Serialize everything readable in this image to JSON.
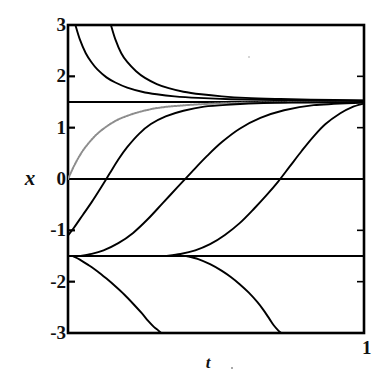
{
  "chart_data": {
    "type": "line",
    "title": "",
    "xlabel": "t",
    "ylabel": "x",
    "xlim": [
      0,
      1
    ],
    "ylim": [
      -3,
      3
    ],
    "grid": false,
    "legend": null,
    "xticklabels": [
      "1"
    ],
    "xtickvalues": [
      1
    ],
    "yticklabels": [
      "3",
      "2",
      "1",
      "0",
      "-1",
      "-2",
      "-3"
    ],
    "ytickvalues": [
      3,
      2,
      1,
      0,
      -1,
      -2,
      -3
    ],
    "asymptotes": [
      {
        "name": "upper-equilibrium",
        "y": 1.5,
        "style": "solid",
        "color": "#000000"
      },
      {
        "name": "zero-line",
        "y": 0.0,
        "style": "solid",
        "color": "#000000"
      },
      {
        "name": "lower-equilibrium",
        "y": -1.5,
        "style": "solid",
        "color": "#000000"
      }
    ],
    "series": [
      {
        "name": "upper-decay-1",
        "color": "#000000",
        "style": "solid",
        "description": "decays from x=3 at t=0.025 down to the upper equilibrium 1.5",
        "x": [
          0.025,
          0.04,
          0.06,
          0.08,
          0.1,
          0.13,
          0.16,
          0.2,
          0.25,
          0.3,
          0.36,
          0.44,
          0.55,
          0.7,
          0.85,
          1.0
        ],
        "y": [
          3.0,
          2.72,
          2.45,
          2.27,
          2.13,
          1.98,
          1.88,
          1.78,
          1.7,
          1.65,
          1.61,
          1.58,
          1.555,
          1.54,
          1.53,
          1.525
        ]
      },
      {
        "name": "upper-decay-2",
        "color": "#000000",
        "style": "solid",
        "description": "decays from x=3 at t=0.145 down to the upper equilibrium 1.5",
        "x": [
          0.145,
          0.16,
          0.18,
          0.2,
          0.23,
          0.26,
          0.3,
          0.34,
          0.39,
          0.45,
          0.52,
          0.6,
          0.7,
          0.82,
          1.0
        ],
        "y": [
          3.0,
          2.72,
          2.45,
          2.28,
          2.1,
          1.97,
          1.85,
          1.77,
          1.7,
          1.65,
          1.61,
          1.58,
          1.56,
          1.545,
          1.53
        ]
      },
      {
        "name": "sigmoid-gray-from-zero",
        "color": "#8d8d8d",
        "style": "dotted",
        "description": "rises from the origin (0,0) to the upper equilibrium 1.5",
        "x": [
          0.0,
          0.02,
          0.04,
          0.06,
          0.09,
          0.12,
          0.16,
          0.2,
          0.25,
          0.31,
          0.38,
          0.46,
          0.56,
          0.68,
          0.82,
          1.0
        ],
        "y": [
          0.0,
          0.25,
          0.46,
          0.63,
          0.83,
          0.98,
          1.13,
          1.23,
          1.32,
          1.39,
          1.43,
          1.46,
          1.48,
          1.49,
          1.495,
          1.5
        ]
      },
      {
        "name": "sigmoid-1",
        "color": "#000000",
        "style": "solid",
        "description": "S-curve from x=-1.1 at t=0 up to the upper equilibrium 1.5",
        "x": [
          0.0,
          0.02,
          0.05,
          0.08,
          0.11,
          0.14,
          0.17,
          0.2,
          0.24,
          0.28,
          0.33,
          0.39,
          0.46,
          0.55,
          0.66,
          0.8,
          1.0
        ],
        "y": [
          -1.1,
          -0.95,
          -0.7,
          -0.45,
          -0.18,
          0.1,
          0.38,
          0.62,
          0.88,
          1.07,
          1.22,
          1.33,
          1.41,
          1.45,
          1.48,
          1.49,
          1.5
        ]
      },
      {
        "name": "sigmoid-2",
        "color": "#000000",
        "style": "solid",
        "description": "S-curve emerging from the lower equilibrium -1.5 near t=0.06, crossing zero at t~0.44, approaching 1.5",
        "x": [
          0.04,
          0.08,
          0.12,
          0.17,
          0.22,
          0.27,
          0.32,
          0.37,
          0.42,
          0.47,
          0.52,
          0.58,
          0.65,
          0.73,
          0.83,
          1.0
        ],
        "y": [
          -1.5,
          -1.46,
          -1.39,
          -1.25,
          -1.05,
          -0.78,
          -0.47,
          -0.16,
          0.15,
          0.45,
          0.72,
          0.98,
          1.19,
          1.34,
          1.44,
          1.49
        ]
      },
      {
        "name": "sigmoid-3",
        "color": "#000000",
        "style": "solid",
        "description": "S-curve emerging from the lower equilibrium -1.5 near t=0.35, crossing zero at t~0.73, approaching 1.5 at t=1",
        "x": [
          0.33,
          0.38,
          0.43,
          0.48,
          0.53,
          0.58,
          0.63,
          0.67,
          0.71,
          0.75,
          0.79,
          0.83,
          0.87,
          0.92,
          0.96,
          1.0
        ],
        "y": [
          -1.5,
          -1.46,
          -1.39,
          -1.27,
          -1.09,
          -0.86,
          -0.57,
          -0.32,
          -0.05,
          0.25,
          0.55,
          0.83,
          1.07,
          1.28,
          1.4,
          1.47
        ]
      },
      {
        "name": "lower-divergence-1",
        "color": "#000000",
        "style": "solid",
        "description": "diverges downward from the lower equilibrium -1.5 near t=0.02 and reaches x=-3 at t~0.32",
        "x": [
          0.015,
          0.04,
          0.07,
          0.1,
          0.13,
          0.16,
          0.19,
          0.22,
          0.25,
          0.27,
          0.29,
          0.305,
          0.315
        ],
        "y": [
          -1.5,
          -1.57,
          -1.68,
          -1.8,
          -1.94,
          -2.09,
          -2.25,
          -2.43,
          -2.62,
          -2.76,
          -2.88,
          -2.95,
          -3.0
        ]
      },
      {
        "name": "lower-divergence-2",
        "color": "#000000",
        "style": "solid",
        "description": "diverges downward from the lower equilibrium -1.5 near t=0.40 and reaches x=-3 at t~0.72",
        "x": [
          0.4,
          0.44,
          0.48,
          0.52,
          0.55,
          0.58,
          0.61,
          0.64,
          0.66,
          0.68,
          0.695,
          0.71,
          0.72
        ],
        "y": [
          -1.5,
          -1.56,
          -1.66,
          -1.79,
          -1.91,
          -2.05,
          -2.21,
          -2.4,
          -2.55,
          -2.72,
          -2.85,
          -2.95,
          -3.0
        ]
      }
    ]
  },
  "axes": {
    "frame_color": "#000000",
    "background": "#ffffff"
  }
}
